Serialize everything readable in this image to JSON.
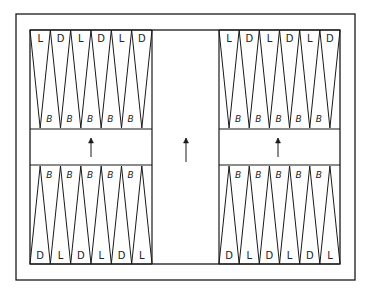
{
  "board": {
    "stroke": "#1a1a1a",
    "background": "#ffffff",
    "outer_frame": {
      "x": 16,
      "y": 14,
      "w": 339,
      "h": 266
    },
    "inner_board": {
      "x": 30,
      "y": 30,
      "w": 310,
      "h": 234
    },
    "bar": {
      "x": 152,
      "w": 67
    },
    "strip": {
      "y_top": 129,
      "y_bottom": 165
    },
    "points_per_quadrant": 6
  },
  "quadrants": {
    "top_left": {
      "outer_labels": [
        "L",
        "D",
        "L",
        "D",
        "L",
        "D"
      ],
      "inner_labels": [
        "B",
        "B",
        "B",
        "B",
        "B"
      ]
    },
    "top_right": {
      "outer_labels": [
        "L",
        "D",
        "L",
        "D",
        "L",
        "D"
      ],
      "inner_labels": [
        "B",
        "B",
        "B",
        "B",
        "B"
      ]
    },
    "bottom_left": {
      "inner_labels": [
        "B",
        "B",
        "B",
        "B",
        "B"
      ],
      "outer_labels": [
        "D",
        "L",
        "D",
        "L",
        "D",
        "L"
      ]
    },
    "bottom_right": {
      "inner_labels": [
        "B",
        "B",
        "B",
        "B",
        "B"
      ],
      "outer_labels": [
        "D",
        "L",
        "D",
        "L",
        "D",
        "L"
      ]
    }
  },
  "arrows": [
    {
      "name": "left-strip-arrow",
      "x": 91,
      "y_tail": 157,
      "y_head": 138,
      "direction": "up"
    },
    {
      "name": "bar-arrow",
      "x": 186,
      "y_tail": 162,
      "y_head": 138,
      "direction": "up"
    },
    {
      "name": "right-strip-arrow",
      "x": 278,
      "y_tail": 157,
      "y_head": 138,
      "direction": "up"
    }
  ]
}
